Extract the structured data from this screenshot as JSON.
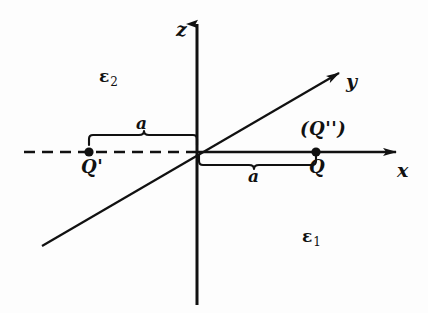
{
  "figure": {
    "kind": "physics-diagram",
    "background_color": "#fdfdfd",
    "ink_color": "#111111"
  },
  "axes": {
    "z": {
      "label": "z",
      "direction": "up",
      "arrow": true
    },
    "x": {
      "label": "x",
      "direction": "right",
      "arrow": true
    },
    "y": {
      "label": "y",
      "direction": "up-right-diagonal",
      "arrow": true
    }
  },
  "media": {
    "upper": {
      "symbol": "ε",
      "subscript": "2",
      "full": "ε2"
    },
    "lower": {
      "symbol": "ε",
      "subscript": "1",
      "full": "ε1"
    }
  },
  "charges": [
    {
      "name": "image-charge",
      "label": "Q'",
      "side": "left",
      "on_axis": "x",
      "sign_position": "negative"
    },
    {
      "name": "real-charge",
      "label": "Q",
      "side": "right",
      "on_axis": "x",
      "sign_position": "positive"
    },
    {
      "name": "secondary-image-charge",
      "label": "(Q'')",
      "side": "right",
      "on_axis": "x",
      "sign_position": "positive"
    }
  ],
  "distances": [
    {
      "name": "left-distance",
      "label": "a",
      "from": "Q'",
      "to": "origin"
    },
    {
      "name": "right-distance",
      "label": "a",
      "from": "origin",
      "to": "Q"
    }
  ],
  "line_styles": {
    "negative_x_axis": "dashed",
    "positive_x_axis": "solid",
    "z_axis": "solid",
    "y_axis": "solid"
  }
}
